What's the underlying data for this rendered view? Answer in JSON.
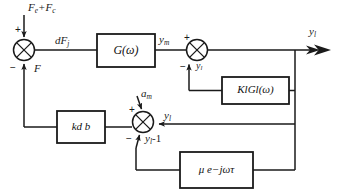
{
  "diagram": {
    "type": "block-diagram",
    "colors": {
      "line": "#1a1a1a",
      "text": "#1a1a1a",
      "background": "#ffffff"
    },
    "blocks": [
      {
        "id": "g-omega",
        "label_html": "G(ω)",
        "label_plain": "G(omega)"
      },
      {
        "id": "kl-gl",
        "label_html": "K<sub>l</sub>G<sub>l</sub>(ω)",
        "label_plain": "Kl Gl(omega)"
      },
      {
        "id": "kd-b",
        "label_html": "k<sub>d</sub> b",
        "label_plain": "kd b"
      },
      {
        "id": "mu-delay",
        "label_html": "μ e<sup>−jωτ</sup>",
        "label_plain": "mu e^(-j omega tau)"
      }
    ],
    "signals": [
      {
        "id": "input-force",
        "label_plain": "Fe+Fc",
        "main": "F",
        "sub": "e",
        "tail": "+F",
        "tail_sub": "c"
      },
      {
        "id": "feedback-f",
        "label_plain": "F",
        "main": "F"
      },
      {
        "id": "error-force",
        "label_plain": "dFj",
        "main": "dF",
        "sub": "j"
      },
      {
        "id": "y-m",
        "label_plain": "ym",
        "main": "y",
        "sub": "m"
      },
      {
        "id": "y-l-junction2",
        "label_plain": "yl",
        "main": "y",
        "sub": "l"
      },
      {
        "id": "y-l-output",
        "label_plain": "yl",
        "main": "y",
        "sub": "l"
      },
      {
        "id": "a-m",
        "label_plain": "am",
        "main": "a",
        "sub": "m"
      },
      {
        "id": "y-l-junction3",
        "label_plain": "yl",
        "main": "y",
        "sub": "l"
      },
      {
        "id": "y-l-minus-one",
        "label_plain": "yl-1",
        "main": "y",
        "sub": "l",
        "tail": "-1"
      }
    ],
    "summing_junctions": [
      {
        "id": "sum-1",
        "signs": {
          "top": "+",
          "bottom_left": "−"
        }
      },
      {
        "id": "sum-2",
        "signs": {
          "top": "+",
          "bottom_left": "−"
        }
      },
      {
        "id": "sum-3",
        "signs": {
          "top": "+",
          "bottom_left": "−"
        }
      }
    ]
  },
  "labels": {
    "input_force_main": "F",
    "input_force_sub_e": "e",
    "input_force_plus": "+F",
    "input_force_sub_c": "c",
    "feedback_force": "F",
    "error_force_main": "dF",
    "error_force_sub": "j",
    "ym_main": "y",
    "ym_sub": "m",
    "yl2_main": "y",
    "yl2_sub": "l",
    "ylout_main": "y",
    "ylout_sub": "l",
    "am_main": "a",
    "am_sub": "m",
    "yl3_main": "y",
    "yl3_sub": "l",
    "ylm1_main": "y",
    "ylm1_sub": "l",
    "ylm1_tail": "-1",
    "g_main": "G(ω)",
    "kl_k": "K",
    "kl_ksub": "l",
    "kl_g": "G",
    "kl_gsub": "l",
    "kl_arg": "(ω)",
    "kd_k": "k",
    "kd_sub": "d",
    "kd_b": "b",
    "mu_main": "μ e",
    "mu_exp": "−jωτ",
    "sign_plus_1": "+",
    "sign_minus_1": "−",
    "sign_plus_2": "+",
    "sign_minus_2": "−",
    "sign_plus_3": "+",
    "sign_minus_3": "−"
  }
}
